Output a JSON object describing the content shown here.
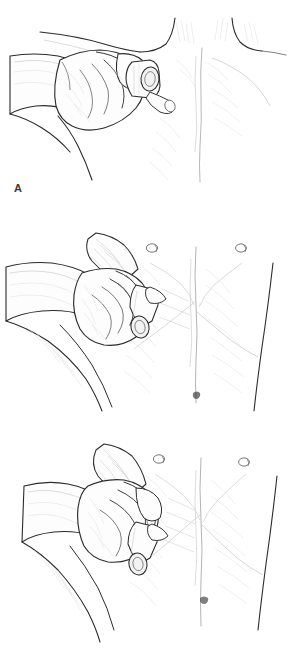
{
  "figure": {
    "type": "medical-illustration",
    "style": "pencil line drawing",
    "background_color": "#ffffff",
    "ink_color": "#2b2b2b",
    "panel_count": 3
  },
  "panels": [
    {
      "label": "A",
      "name": "panel-a",
      "region": "upper chest / infraclavicular",
      "landmarks": [
        "clavicle",
        "suprasternal notch",
        "sternum",
        "shoulder",
        "neck"
      ],
      "hand": "right hand, fingers curled, thumb over instrument",
      "instrument": "cylindrical bell with elliptical open face",
      "instrument_position": "below right clavicle"
    },
    {
      "label": "B",
      "name": "panel-b",
      "region": "mid chest / nipple line",
      "landmarks": [
        "nipple",
        "areola",
        "sternum",
        "rib margin",
        "umbilicus",
        "lateral torso edge"
      ],
      "hand": "right hand, fingers curled, forearm extended left",
      "instrument": "cylindrical bell with elliptical open face",
      "instrument_position": "lateral mid chest, fifth intercostal space"
    },
    {
      "label": "C",
      "name": "panel-c",
      "region": "lower chest / flank",
      "landmarks": [
        "nipple",
        "areola",
        "costal margin",
        "umbilicus",
        "lateral torso edge"
      ],
      "hand": "right hand, fingers extended, gripping instrument",
      "instrument": "cylindrical bell with elliptical open face",
      "instrument_position": "lower lateral chest wall"
    }
  ],
  "colors": {
    "background": "#ffffff",
    "label_text": "#3a3a3a",
    "outline_strong": "#2b2b2b",
    "outline_mid": "#5e5e5e",
    "shading_soft": "#9a9a9a",
    "shading_faint": "#c6c6c6"
  }
}
